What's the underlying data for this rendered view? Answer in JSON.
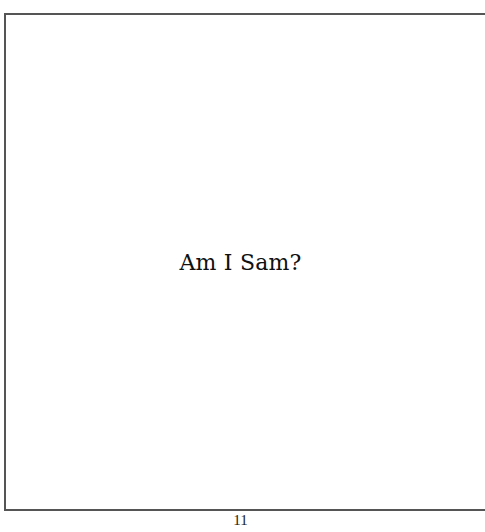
{
  "page": {
    "text": "Am I Sam?",
    "page_number": "11"
  },
  "colors": {
    "border": "#555555",
    "text": "#111111",
    "background": "#ffffff"
  }
}
